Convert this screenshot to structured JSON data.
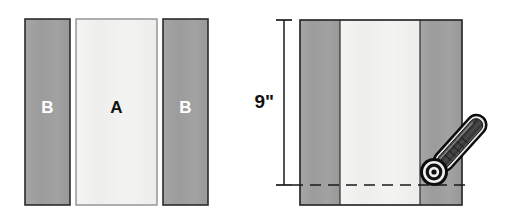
{
  "figure": {
    "type": "sewing-construction-diagram",
    "colors": {
      "fabric_b": "#9e9e9e",
      "fabric_b_shade": "#979797",
      "fabric_a": "#f1f1ef",
      "outline": "#2b2b2b",
      "label_light": "#ffffff",
      "label_dark": "#111111",
      "dash_line": "#1a1a1a",
      "tool_body_dark": "#3a3a3a",
      "tool_body_mid": "#707070",
      "tool_outline": "#111111",
      "tool_highlight": "#e8e8e8",
      "background": "#ffffff"
    }
  },
  "left_figure": {
    "name": "separate-strips",
    "strips": [
      {
        "id": "b-left",
        "label": "B",
        "fill": "fabric_b",
        "label_color": "label_light",
        "x": 25,
        "y": 19,
        "w": 45,
        "h": 186
      },
      {
        "id": "a-center",
        "label": "A",
        "fill": "fabric_a",
        "label_color": "label_dark",
        "x": 76,
        "y": 19,
        "w": 81,
        "h": 186
      },
      {
        "id": "b-right",
        "label": "B",
        "fill": "fabric_b",
        "label_color": "label_light",
        "x": 163,
        "y": 19,
        "w": 45,
        "h": 186
      }
    ]
  },
  "right_figure": {
    "name": "joined-strip-set-with-cutter",
    "strips": [
      {
        "id": "b-left",
        "label": "",
        "fill": "fabric_b",
        "x": 300,
        "y": 20,
        "w": 40,
        "h": 185
      },
      {
        "id": "a-center",
        "label": "",
        "fill": "fabric_a",
        "x": 340,
        "y": 20,
        "w": 80,
        "h": 185
      },
      {
        "id": "b-right",
        "label": "",
        "fill": "fabric_b",
        "x": 420,
        "y": 20,
        "w": 42,
        "h": 185
      }
    ],
    "dimension": {
      "name": "height-dimension",
      "label": "9\"",
      "value": 9,
      "unit": "inch",
      "axis_x": 284,
      "top_y": 20,
      "bottom_y": 185,
      "tick_half_width": 8,
      "label_x": 275,
      "label_y": 103
    },
    "cut_line": {
      "name": "cut-guide-line",
      "style": "dashed",
      "y": 185,
      "x1": 292,
      "x2": 470
    },
    "rotary_cutter": {
      "name": "rotary-cutter",
      "handle_angle_deg": -48,
      "blade_center": {
        "x": 434,
        "y": 172
      },
      "blade_outer_r": 14,
      "blade_mid_r": 9,
      "blade_hub_r": 5,
      "blade_center_r": 2.5,
      "handle_length": 66,
      "handle_width": 17
    }
  }
}
